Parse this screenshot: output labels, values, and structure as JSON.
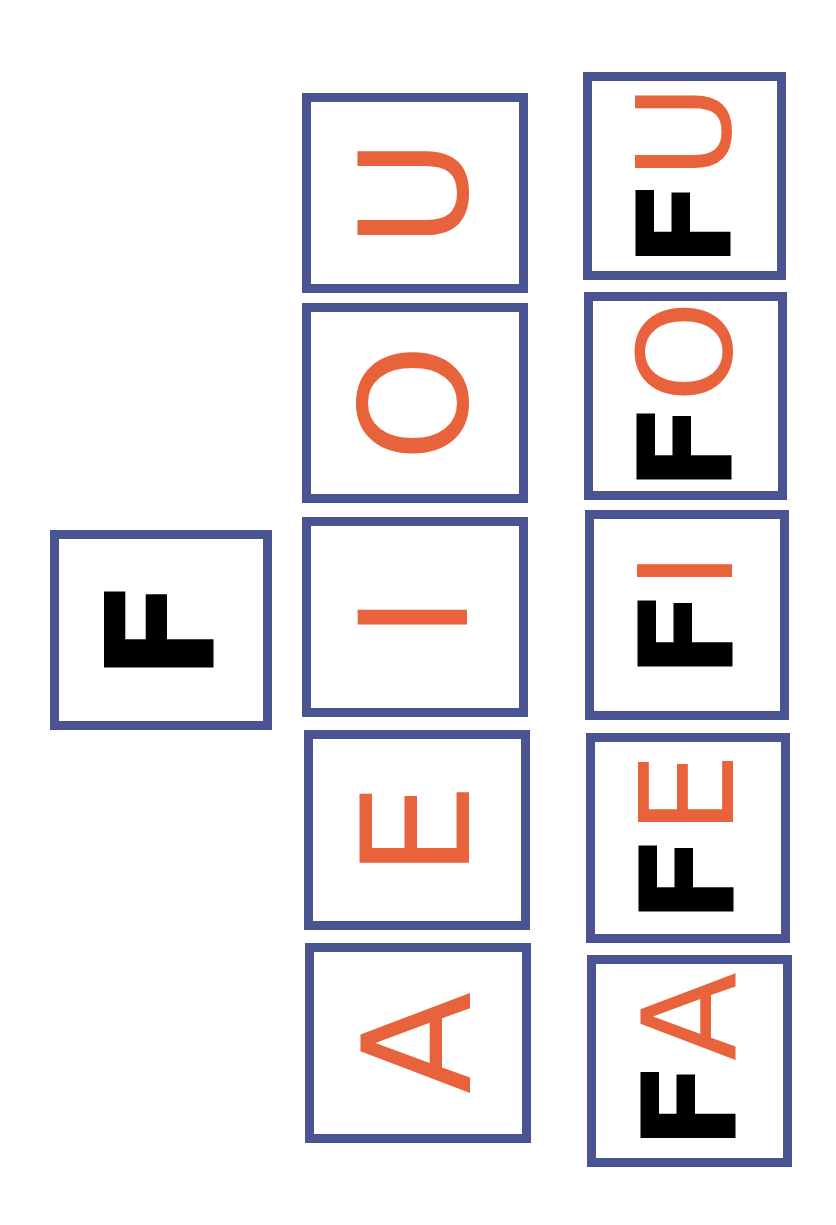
{
  "colors": {
    "border": "#4a5492",
    "consonant": "#000000",
    "vowel": "#e8623c",
    "background": "#ffffff"
  },
  "orientation": "page rotated 90deg clockwise; text reads bottom-to-top",
  "consonant_card": {
    "letter": "F"
  },
  "vowel_cards": [
    {
      "letter": "U"
    },
    {
      "letter": "O"
    },
    {
      "letter": "I"
    },
    {
      "letter": "E"
    },
    {
      "letter": "A"
    }
  ],
  "syllable_cards": [
    {
      "consonant": "F",
      "vowel": "U"
    },
    {
      "consonant": "F",
      "vowel": "O"
    },
    {
      "consonant": "F",
      "vowel": "I"
    },
    {
      "consonant": "F",
      "vowel": "E"
    },
    {
      "consonant": "F",
      "vowel": "A"
    }
  ]
}
